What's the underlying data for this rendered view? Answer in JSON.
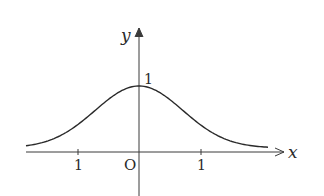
{
  "diagram": {
    "axes": {
      "x_label": "x",
      "y_label": "y",
      "origin_label": "O",
      "x_ticks": [
        {
          "label": "1",
          "value": -1
        },
        {
          "label": "1",
          "value": 1
        }
      ],
      "y_ticks": [
        {
          "label": "1",
          "value": 1
        }
      ]
    },
    "curve": {
      "description": "symmetric bell curve with maximum 1 at x = 0, approaching 0 as |x| grows",
      "peak": {
        "x": 0,
        "y": 1
      },
      "color": "#2a2a2a"
    },
    "colors": {
      "axis": "#3a3a3a",
      "curve": "#2a2a2a",
      "background": "#ffffff"
    }
  }
}
